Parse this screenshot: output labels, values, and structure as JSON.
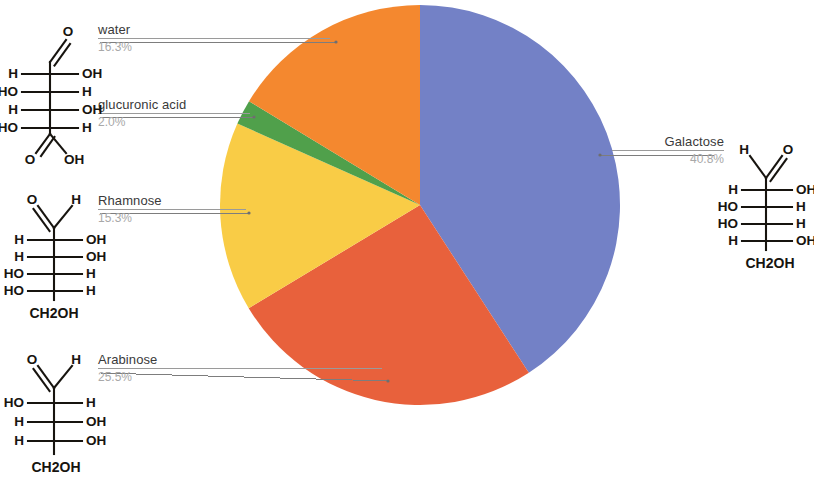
{
  "chart_data": {
    "type": "pie",
    "title": "",
    "categories": [
      "Galactose",
      "Arabinose",
      "Rhamnose",
      "glucuronic acid",
      "water"
    ],
    "values": [
      40.8,
      25.5,
      15.3,
      2.0,
      16.3
    ],
    "value_labels": [
      "40.8%",
      "25.5%",
      "15.3%",
      "2.0%",
      "16.3%"
    ],
    "colors": [
      "#7381c6",
      "#e8613c",
      "#f9cc46",
      "#52a css",
      "#f4882f"
    ],
    "slice_colors": [
      "#7381c6",
      "#e8613c",
      "#f9cc46",
      "#50a04b",
      "#f4882f"
    ],
    "start_angle_deg": 0,
    "direction": "clockwise",
    "legend": "callout-labels",
    "grid": false,
    "units": "percent"
  },
  "callouts": {
    "water": {
      "name": "water",
      "value": "16.3%"
    },
    "glucuronic": {
      "name": "glucuronic acid",
      "value": "2.0%"
    },
    "rhamnose": {
      "name": "Rhamnose",
      "value": "15.3%"
    },
    "arabinose": {
      "name": "Arabinose",
      "value": "25.5%"
    },
    "galactose": {
      "name": "Galactose",
      "value": "40.8%"
    }
  },
  "structures": {
    "glucuronic": {
      "name": "glucuronic-acid-fischer-projection",
      "top_left": "O",
      "rows": [
        {
          "left": "H",
          "right": "OH"
        },
        {
          "left": "HO",
          "right": "H"
        },
        {
          "left": "H",
          "right": "OH"
        },
        {
          "left": "HO",
          "right": "H"
        }
      ],
      "bottom_left": "O",
      "bottom_right": "OH"
    },
    "rhamnose": {
      "name": "rhamnose-fischer-projection",
      "top_left": "O",
      "top_right": "H",
      "rows": [
        {
          "left": "H",
          "right": "OH"
        },
        {
          "left": "H",
          "right": "OH"
        },
        {
          "left": "HO",
          "right": "H"
        },
        {
          "left": "HO",
          "right": "H"
        }
      ],
      "bottom": "CH2OH"
    },
    "arabinose": {
      "name": "arabinose-fischer-projection",
      "top_left": "O",
      "top_right": "H",
      "rows": [
        {
          "left": "HO",
          "right": "H"
        },
        {
          "left": "H",
          "right": "OH"
        },
        {
          "left": "H",
          "right": "OH"
        }
      ],
      "bottom": "CH2OH"
    },
    "galactose": {
      "name": "galactose-fischer-projection",
      "top_left": "H",
      "top_right": "O",
      "rows": [
        {
          "left": "H",
          "right": "OH"
        },
        {
          "left": "HO",
          "right": "H"
        },
        {
          "left": "HO",
          "right": "H"
        },
        {
          "left": "H",
          "right": "OH"
        }
      ],
      "bottom": "CH2OH"
    }
  }
}
